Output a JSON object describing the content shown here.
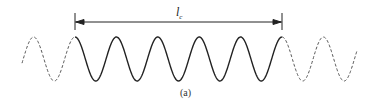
{
  "diagram": {
    "dimension_label": "l",
    "dimension_subscript": "c",
    "caption": "(a)",
    "stroke_color": "#222222",
    "dashed_color": "#555555",
    "wave": {
      "solid_start_x": 75,
      "solid_end_x": 282,
      "period": 41.4,
      "peak_y": 37,
      "trough_y": 81,
      "dashed_left_start_x": 22,
      "dashed_right_end_x": 357
    },
    "dimension_line": {
      "x1": 75,
      "x2": 282,
      "y": 22
    }
  }
}
